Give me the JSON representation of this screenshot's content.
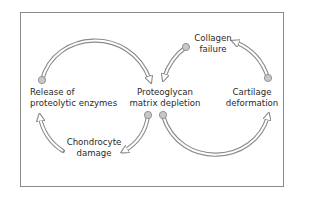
{
  "diagram": {
    "type": "cycle",
    "colors": {
      "frame": "#8a8a8a",
      "arrow_fill": "#ffffff",
      "arrow_stroke": "#8a8a8a",
      "node_dot": "#c8c8c8",
      "text": "#2a2a2a"
    },
    "nodes": [
      {
        "id": "release",
        "lines": [
          "Release of",
          "proteolytic enzymes"
        ]
      },
      {
        "id": "proteoglycan",
        "lines": [
          "Proteoglycan",
          "matrix depletion"
        ]
      },
      {
        "id": "collagen",
        "lines": [
          "Collagen",
          "failure"
        ]
      },
      {
        "id": "cartilage",
        "lines": [
          "Cartilage",
          "deformation"
        ]
      },
      {
        "id": "chondrocyte",
        "lines": [
          "Chondrocyte",
          "damage"
        ]
      }
    ],
    "edges": [
      {
        "from": "release",
        "to": "proteoglycan",
        "shape": "arc-top"
      },
      {
        "from": "proteoglycan",
        "to": "cartilage",
        "shape": "arc-bottom"
      },
      {
        "from": "cartilage",
        "to": "collagen",
        "shape": "arc-right"
      },
      {
        "from": "collagen",
        "to": "proteoglycan",
        "shape": "arc-diagonal"
      },
      {
        "from": "proteoglycan",
        "to": "chondrocyte",
        "shape": "arc-diagonal"
      },
      {
        "from": "chondrocyte",
        "to": "release",
        "shape": "arc-left"
      }
    ]
  }
}
